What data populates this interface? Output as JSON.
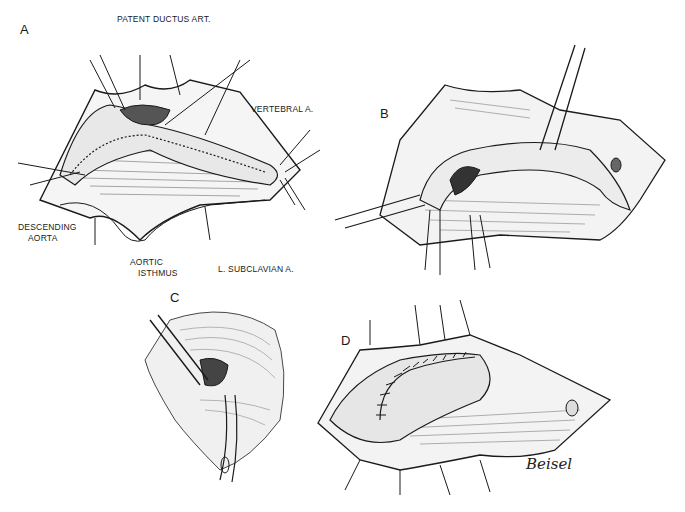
{
  "figure": {
    "panels": [
      {
        "letter": "A"
      },
      {
        "letter": "B"
      },
      {
        "letter": "C"
      },
      {
        "letter": "D"
      }
    ],
    "labels": {
      "patent_ductus": "PATENT DUCTUS ART.",
      "vertebral": "VERTEBRAL A.",
      "descending_aorta_1": "DESCENDING",
      "descending_aorta_2": "AORTA",
      "aortic_isthmus_1": "AORTIC",
      "aortic_isthmus_2": "ISTHMUS",
      "subclavian": "L. SUBCLAVIAN A."
    },
    "signature": "Beisel",
    "colors": {
      "ink": "#1a1a1a",
      "paper": "#ffffff"
    }
  }
}
